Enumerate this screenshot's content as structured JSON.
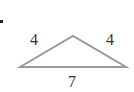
{
  "diagram": {
    "type": "triangle",
    "labels": {
      "left_side": "4",
      "right_side": "4",
      "base": "7"
    },
    "vertices": {
      "apex": [
        73,
        36
      ],
      "base_left": [
        20,
        67
      ],
      "base_right": [
        126,
        67
      ]
    },
    "colors": {
      "stroke": "#9a9a9a",
      "text": "#333333",
      "marker": "#222222"
    }
  }
}
